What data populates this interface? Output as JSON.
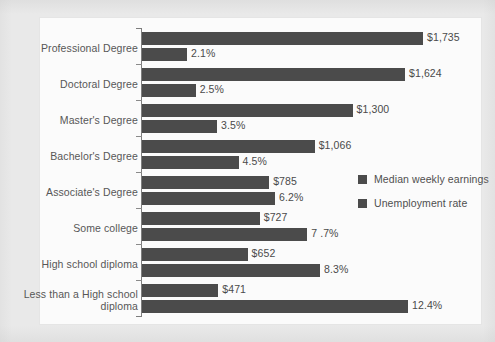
{
  "chart_data": {
    "type": "bar",
    "orientation": "horizontal",
    "grouped": true,
    "title": "",
    "subtitle": "",
    "xlabel": "",
    "ylabel": "",
    "grid": false,
    "legend_position": "center-right",
    "categories": [
      "Professional Degree",
      "Doctoral Degree",
      "Master's Degree",
      "Bachelor's Degree",
      "Associate's Degree",
      "Some college",
      "High school diploma",
      "Less than a High school diploma"
    ],
    "series": [
      {
        "name": "Median weekly earnings",
        "unit": "USD",
        "values": [
          1735,
          1624,
          1300,
          1066,
          785,
          727,
          652,
          471
        ],
        "labels": [
          "$1,735",
          "$1,624",
          "$1,300",
          "$1,066",
          "$785",
          "$727",
          "$652",
          "$471"
        ],
        "color": "#4b4b4b",
        "max": 1735
      },
      {
        "name": "Unemployment rate",
        "unit": "percent",
        "values": [
          2.1,
          2.5,
          3.5,
          4.5,
          6.2,
          7.7,
          8.3,
          12.4
        ],
        "labels": [
          "2.1%",
          "2.5%",
          "3.5%",
          "4.5%",
          "6.2%",
          "7 .7%",
          "8.3%",
          "12.4%"
        ],
        "color": "#4b4b4b",
        "max": 12.4
      }
    ]
  },
  "legend": {
    "items": [
      {
        "label": "Median weekly earnings",
        "swatch_color": "#4b4b4b"
      },
      {
        "label": "Unemployment rate",
        "swatch_color": "#4b4b4b"
      }
    ]
  },
  "colors": {
    "bar": "#4b4b4b",
    "text": "#555555",
    "axis": "#7d7d7d",
    "plot_background": "#fbfbfb",
    "page_background": "#e9e9e9"
  }
}
